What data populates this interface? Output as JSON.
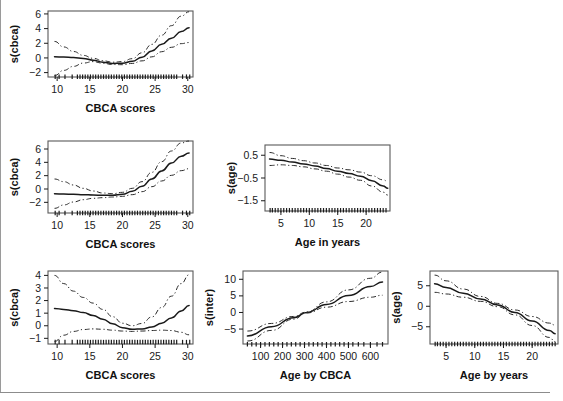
{
  "figure": {
    "background": "#ffffff",
    "ink_color": "#1a1a1a",
    "frame_color": "#5a5a5a",
    "has_left_rule": true,
    "has_footer_rule": true
  },
  "chart_data": [
    {
      "id": "panel-top-cbca",
      "type": "line",
      "title": "",
      "xlabel": "CBCA scores",
      "ylabel": "s(cbca)",
      "xlim": [
        8.6,
        30.8
      ],
      "ylim": [
        -2.6,
        6.4
      ],
      "xticks": [
        10,
        15,
        20,
        25,
        30
      ],
      "yticks": [
        -2,
        0,
        2,
        4,
        6
      ],
      "grid": false,
      "legend": "none",
      "series": [
        {
          "name": "fit",
          "style": "solid",
          "x": [
            9.6,
            11,
            12.5,
            14,
            15.5,
            17,
            18.5,
            20,
            21.5,
            23,
            24.5,
            26,
            27.5,
            29,
            30.2
          ],
          "y": [
            0.15,
            0.12,
            0.05,
            -0.08,
            -0.3,
            -0.58,
            -0.75,
            -0.72,
            -0.45,
            0.1,
            0.95,
            1.85,
            2.7,
            3.6,
            4.1
          ]
        },
        {
          "name": "upper-ci",
          "style": "dashdot",
          "x": [
            9.6,
            11,
            12.5,
            14,
            15.5,
            17,
            18.5,
            20,
            21.5,
            23,
            24.5,
            26,
            27.5,
            29,
            30.2
          ],
          "y": [
            2.25,
            1.5,
            0.88,
            0.35,
            -0.05,
            -0.38,
            -0.58,
            -0.5,
            -0.1,
            0.7,
            1.85,
            3.1,
            4.4,
            5.7,
            6.3
          ]
        },
        {
          "name": "lower-ci",
          "style": "dashdot",
          "x": [
            9.6,
            11,
            12.5,
            14,
            15.5,
            17,
            18.5,
            20,
            21.5,
            23,
            24.5,
            26,
            27.5,
            29,
            30.2
          ],
          "y": [
            -2.4,
            -1.7,
            -1.15,
            -0.7,
            -0.5,
            -0.72,
            -0.9,
            -0.92,
            -0.75,
            -0.4,
            0.15,
            0.85,
            1.45,
            1.95,
            2.1
          ]
        }
      ],
      "rug": {
        "y": -2.25,
        "x": [
          9.7,
          10.3,
          11.2,
          12.3,
          13.1,
          13.5,
          13.9,
          14.3,
          14.7,
          15.1,
          15.5,
          15.9,
          16.3,
          16.7,
          17.1,
          17.5,
          17.9,
          18.3,
          18.7,
          19.1,
          19.5,
          19.9,
          20.3,
          20.7,
          21.1,
          21.5,
          21.9,
          22.3,
          22.7,
          23.1,
          23.5,
          23.9,
          24.3,
          24.7,
          25.1,
          25.5,
          25.9,
          26.3,
          26.7,
          27.1,
          27.5,
          27.9,
          28.3,
          29.2,
          29.8,
          30.3
        ]
      }
    },
    {
      "id": "panel-mid-cbca",
      "type": "line",
      "title": "",
      "xlabel": "CBCA scores",
      "ylabel": "s(cbca)",
      "xlim": [
        8.6,
        30.8
      ],
      "ylim": [
        -3.6,
        7.2
      ],
      "xticks": [
        10,
        15,
        20,
        25,
        30
      ],
      "yticks": [
        -2,
        0,
        2,
        4,
        6
      ],
      "grid": false,
      "legend": "none",
      "series": [
        {
          "name": "fit",
          "style": "solid",
          "x": [
            9.6,
            11,
            12.5,
            14,
            15.5,
            17,
            18.5,
            20,
            21.5,
            23,
            24.5,
            26,
            27.5,
            29,
            30.2
          ],
          "y": [
            -0.72,
            -0.75,
            -0.8,
            -0.85,
            -0.9,
            -0.95,
            -0.95,
            -0.8,
            -0.35,
            0.4,
            1.5,
            2.7,
            3.9,
            4.9,
            5.4
          ]
        },
        {
          "name": "upper-ci",
          "style": "dashdot",
          "x": [
            9.6,
            11,
            12.5,
            14,
            15.5,
            17,
            18.5,
            20,
            21.5,
            23,
            24.5,
            26,
            27.5,
            29,
            30.2
          ],
          "y": [
            1.5,
            1.1,
            0.6,
            0.1,
            -0.3,
            -0.6,
            -0.7,
            -0.5,
            0.1,
            1.1,
            2.5,
            4.1,
            5.7,
            6.9,
            7.2
          ]
        },
        {
          "name": "lower-ci",
          "style": "dashdot",
          "x": [
            9.6,
            11,
            12.5,
            14,
            15.5,
            17,
            18.5,
            20,
            21.5,
            23,
            24.5,
            26,
            27.5,
            29,
            30.2
          ],
          "y": [
            -2.9,
            -2.4,
            -1.95,
            -1.6,
            -1.4,
            -1.3,
            -1.2,
            -1.1,
            -0.85,
            -0.4,
            0.35,
            1.2,
            2.05,
            2.75,
            3.05
          ]
        }
      ],
      "rug": {
        "y": -3.25,
        "x": [
          9.7,
          10.3,
          11.2,
          12.3,
          13.1,
          13.5,
          13.9,
          14.3,
          14.7,
          15.1,
          15.5,
          15.9,
          16.3,
          16.7,
          17.1,
          17.5,
          17.9,
          18.3,
          18.7,
          19.1,
          19.5,
          19.9,
          20.3,
          20.7,
          21.1,
          21.5,
          21.9,
          22.3,
          22.7,
          23.1,
          23.5,
          23.9,
          24.3,
          24.7,
          25.1,
          25.5,
          25.9,
          26.3,
          26.7,
          27.1,
          27.5,
          27.9,
          28.3,
          29.2,
          29.8,
          30.3
        ]
      }
    },
    {
      "id": "panel-mid-age",
      "type": "line",
      "title": "",
      "xlabel": "Age in years",
      "ylabel": "s(age)",
      "xlim": [
        2.2,
        24.2
      ],
      "ylim": [
        -1.95,
        0.95
      ],
      "xticks": [
        5,
        10,
        15,
        20
      ],
      "yticks": [
        0.5,
        -0.5,
        -1.5
      ],
      "grid": false,
      "legend": "none",
      "series": [
        {
          "name": "fit",
          "style": "solid",
          "x": [
            3,
            5,
            7,
            9,
            11,
            13,
            15,
            17,
            19,
            21,
            23,
            23.8
          ],
          "y": [
            0.33,
            0.28,
            0.2,
            0.12,
            0.03,
            -0.08,
            -0.2,
            -0.3,
            -0.42,
            -0.62,
            -0.85,
            -0.95
          ]
        },
        {
          "name": "upper-ci",
          "style": "dashdot",
          "x": [
            3,
            5,
            7,
            9,
            11,
            13,
            15,
            17,
            19,
            21,
            23,
            23.8
          ],
          "y": [
            0.62,
            0.48,
            0.36,
            0.26,
            0.16,
            0.05,
            -0.06,
            -0.14,
            -0.24,
            -0.4,
            -0.58,
            -0.65
          ]
        },
        {
          "name": "lower-ci",
          "style": "dashdot",
          "x": [
            3,
            5,
            7,
            9,
            11,
            13,
            15,
            17,
            19,
            21,
            23,
            23.8
          ],
          "y": [
            0.05,
            0.08,
            0.05,
            -0.01,
            -0.1,
            -0.2,
            -0.33,
            -0.46,
            -0.6,
            -0.85,
            -1.12,
            -1.25
          ]
        }
      ],
      "rug": {
        "y": -1.82,
        "x": [
          3.1,
          3.5,
          4,
          4.5,
          5,
          5.5,
          6,
          6.5,
          7,
          7.5,
          8,
          8.5,
          9,
          9.5,
          10,
          10.5,
          11,
          11.5,
          12,
          12.5,
          13,
          13.5,
          14,
          14.5,
          15,
          15.5,
          16,
          16.5,
          17,
          17.5,
          18,
          18.5,
          19,
          19.5,
          20,
          20.5,
          21,
          21.5,
          22,
          22.5,
          23,
          23.5
        ]
      }
    },
    {
      "id": "panel-bot-cbca",
      "type": "line",
      "title": "",
      "xlabel": "CBCA scores",
      "ylabel": "s(cbca)",
      "xlim": [
        8.6,
        30.8
      ],
      "ylim": [
        -1.45,
        4.35
      ],
      "xticks": [
        10,
        15,
        20,
        25,
        30
      ],
      "yticks": [
        -1,
        0,
        1,
        2,
        3,
        4
      ],
      "grid": false,
      "legend": "none",
      "series": [
        {
          "name": "fit",
          "style": "solid",
          "x": [
            9.6,
            11,
            12.5,
            14,
            15.5,
            17,
            18.5,
            20,
            21.5,
            23,
            24.5,
            26,
            27.5,
            29,
            30.2
          ],
          "y": [
            1.38,
            1.3,
            1.2,
            1.05,
            0.82,
            0.52,
            0.15,
            -0.15,
            -0.28,
            -0.25,
            -0.1,
            0.2,
            0.62,
            1.18,
            1.6
          ]
        },
        {
          "name": "upper-ci",
          "style": "dashdot",
          "x": [
            9.6,
            11,
            12.5,
            14,
            15.5,
            17,
            18.5,
            20,
            21.5,
            23,
            24.5,
            26,
            27.5,
            29,
            30.2
          ],
          "y": [
            4.0,
            3.35,
            2.75,
            2.25,
            1.8,
            1.3,
            0.72,
            0.2,
            0.0,
            0.18,
            0.7,
            1.45,
            2.35,
            3.35,
            4.05
          ]
        },
        {
          "name": "lower-ci",
          "style": "dashdot",
          "x": [
            9.6,
            11,
            12.5,
            14,
            15.5,
            17,
            18.5,
            20,
            21.5,
            23,
            24.5,
            26,
            27.5,
            29,
            30.2
          ],
          "y": [
            -1.25,
            -0.75,
            -0.45,
            -0.3,
            -0.25,
            -0.28,
            -0.35,
            -0.42,
            -0.45,
            -0.42,
            -0.38,
            -0.35,
            -0.38,
            -0.52,
            -0.72
          ]
        }
      ],
      "rug": {
        "y": -1.12,
        "x": [
          9.7,
          10.3,
          11.2,
          12.3,
          13.1,
          13.5,
          13.9,
          14.3,
          14.7,
          15.1,
          15.5,
          15.9,
          16.3,
          16.7,
          17.1,
          17.5,
          17.9,
          18.3,
          18.7,
          19.1,
          19.5,
          19.9,
          20.3,
          20.7,
          21.1,
          21.5,
          21.9,
          22.3,
          22.7,
          23.1,
          23.5,
          23.9,
          24.3,
          24.7,
          25.1,
          25.5,
          25.9,
          26.3,
          26.7,
          27.1,
          27.5,
          27.9,
          28.3,
          29.2,
          29.8,
          30.3
        ]
      }
    },
    {
      "id": "panel-bot-inter",
      "type": "line",
      "title": "",
      "xlabel": "Age by CBCA",
      "ylabel": "s(inter)",
      "xlim": [
        20,
        680
      ],
      "ylim": [
        -9.5,
        12.5
      ],
      "xticks": [
        100,
        200,
        300,
        400,
        500,
        600
      ],
      "yticks": [
        -5,
        0,
        5,
        10
      ],
      "grid": false,
      "legend": "none",
      "series": [
        {
          "name": "fit",
          "style": "solid",
          "x": [
            40,
            150,
            250,
            310,
            400,
            500,
            600,
            655
          ],
          "y": [
            -7.1,
            -4.3,
            -1.6,
            0.0,
            2.4,
            5.1,
            7.8,
            9.2
          ]
        },
        {
          "name": "upper-ci",
          "style": "dashdot",
          "x": [
            40,
            150,
            250,
            310,
            400,
            500,
            600,
            655
          ],
          "y": [
            -5.6,
            -3.3,
            -1.2,
            0.15,
            3.2,
            6.8,
            10.3,
            12.2
          ]
        },
        {
          "name": "lower-ci",
          "style": "dashdot",
          "x": [
            40,
            150,
            250,
            310,
            400,
            500,
            600,
            655
          ],
          "y": [
            -8.6,
            -5.4,
            -2.0,
            -0.15,
            1.6,
            3.3,
            4.6,
            5.2
          ]
        }
      ],
      "rug": {
        "y": -8.9,
        "x": [
          40,
          60,
          80,
          100,
          120,
          140,
          160,
          180,
          200,
          220,
          240,
          260,
          280,
          300,
          320,
          340,
          360,
          380,
          400,
          420,
          440,
          460,
          480,
          500,
          520,
          545,
          570,
          600,
          630,
          655
        ]
      }
    },
    {
      "id": "panel-bot-age",
      "type": "line",
      "title": "",
      "xlabel": "Age by years",
      "ylabel": "s(age)",
      "xlim": [
        2.2,
        24.5
      ],
      "ylim": [
        -9.2,
        8.6
      ],
      "xticks": [
        5,
        10,
        15,
        20
      ],
      "yticks": [
        -5,
        0,
        5
      ],
      "grid": false,
      "legend": "none",
      "series": [
        {
          "name": "fit",
          "style": "solid",
          "x": [
            3,
            5,
            8,
            11,
            14,
            17,
            20,
            23,
            24
          ],
          "y": [
            5.5,
            4.6,
            3.2,
            1.8,
            0.3,
            -1.5,
            -3.6,
            -5.9,
            -6.7
          ]
        },
        {
          "name": "upper-ci",
          "style": "dashdot",
          "x": [
            3,
            5,
            8,
            11,
            14,
            17,
            20,
            23,
            24
          ],
          "y": [
            7.6,
            6.2,
            4.2,
            2.4,
            0.7,
            -0.9,
            -2.5,
            -4.1,
            -4.6
          ]
        },
        {
          "name": "lower-ci",
          "style": "dashdot",
          "x": [
            3,
            5,
            8,
            11,
            14,
            17,
            20,
            23,
            24
          ],
          "y": [
            3.4,
            3.0,
            2.2,
            1.2,
            -0.1,
            -2.1,
            -4.7,
            -7.6,
            -8.6
          ]
        }
      ],
      "rug": {
        "y": -8.65,
        "x": [
          3.1,
          3.5,
          4,
          4.5,
          5,
          5.5,
          6,
          6.5,
          7,
          7.5,
          8,
          8.5,
          9,
          9.5,
          10,
          10.5,
          11,
          11.5,
          12,
          12.5,
          13,
          13.5,
          14,
          14.5,
          15,
          15.5,
          16,
          16.5,
          17,
          17.5,
          18,
          18.5,
          19,
          19.5,
          20,
          20.5,
          21,
          21.5,
          22,
          22.5,
          23,
          23.5,
          24
        ]
      }
    }
  ]
}
